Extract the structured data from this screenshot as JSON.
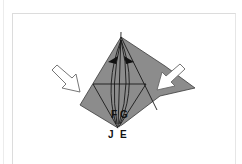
{
  "diagram": {
    "type": "origami-fold-step",
    "labels": {
      "f": "F",
      "g": "G",
      "j": "J",
      "e": "E"
    },
    "arrows": {
      "left": "push-in-arrow",
      "right": "push-in-arrow",
      "top": "swivel-arrows"
    },
    "colors": {
      "paper": "#8c8c8c",
      "lines": "#1a1a1a",
      "arrow_fill": "#ffffff",
      "arrow_stroke": "#555555",
      "background": "#ffffff"
    }
  }
}
